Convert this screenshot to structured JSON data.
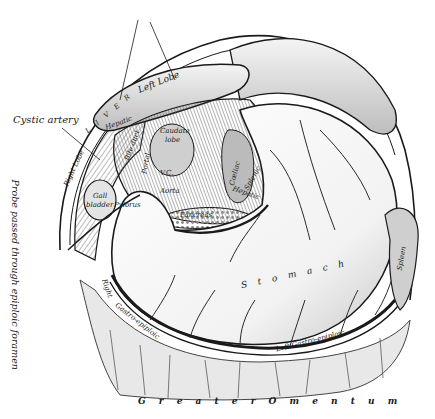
{
  "figure": {
    "colors": {
      "background": "#ffffff",
      "ink": "#1a1a1a",
      "shade_dark": "#555555",
      "shade_mid": "#9a9a9a",
      "shade_light": "#d6d6d6"
    }
  },
  "labels": {
    "left_lobe": "Left Lobe",
    "liver_arc": "L I V E R",
    "cystic_artery": "Cystic artery",
    "right_lobe": "Right Lobe",
    "hepatic": "Hepatic",
    "caudate_lobe_1": "Caudate",
    "caudate_lobe_2": "lobe",
    "bile_duct": "Bile duct",
    "portal": "Portal",
    "vena_cava": "V.C.",
    "aorta": "Aorta",
    "coeliac": "Cœliac",
    "splenic": "Splenic",
    "hepatic_artery": "Hepatic",
    "gall_bladder_1": "Gall",
    "gall_bladder_2": "bladder",
    "pylorus": "Pylorus",
    "pancreas": "Pancreas",
    "probe": "Probe passed through epiploic foramen",
    "stomach": "S t o m a c h",
    "spleen": "Spleen",
    "right_gastro_epiploic_1": "Right",
    "right_gastro_epiploic_2": "Gastro-epiploic",
    "left_gastro_epiploic": "Left Gastro-epiploic",
    "greater_omentum": "G r e a t e r   O m e n t u m"
  }
}
